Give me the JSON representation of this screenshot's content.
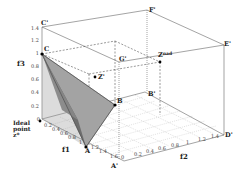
{
  "figure": {
    "axes": {
      "x_label": "f1",
      "y_label": "f2",
      "z_label": "f3",
      "f1_ticks": [
        "0.2",
        "0.4",
        "0.6",
        "0.8",
        "1",
        "1.2",
        "1.4",
        "1.6"
      ],
      "f2_ticks": [
        "0",
        "0.2",
        "0.4",
        "0.6",
        "0.8",
        "1",
        "1.2",
        "1.4"
      ],
      "f3_ticks": [
        "0",
        "0.2",
        "0.4",
        "0.6",
        "0.8",
        "1",
        "1.2",
        "1.4"
      ]
    },
    "points": {
      "A": "A",
      "B": "B",
      "C": "C",
      "A_prime": "A'",
      "B_prime": "B'",
      "C_prime": "C'",
      "D_prime": "D'",
      "E_prime": "E'",
      "F_prime": "F'",
      "G_prime": "G'",
      "Z_prime": "Z'",
      "Z_nad": "Z",
      "Z_nad_sup": "nad",
      "ideal_line1": "Ideal",
      "ideal_line2": "point",
      "ideal_line3": "z*"
    },
    "colors": {
      "surface_dark": "#6f6f6f",
      "surface_light": "#a8a8a8",
      "lines": "#555555",
      "grid": "#999999"
    }
  }
}
